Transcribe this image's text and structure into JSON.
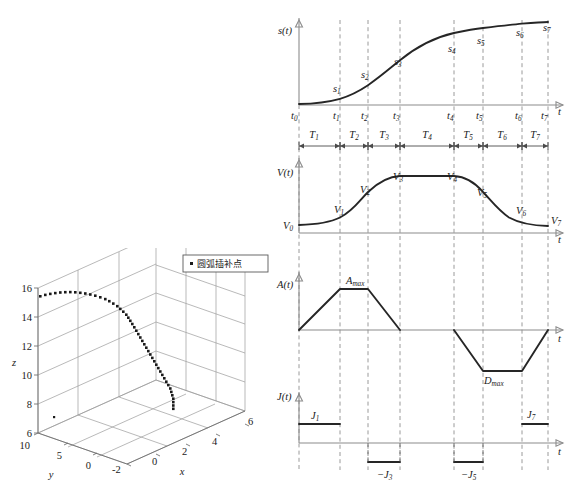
{
  "figure": {
    "background": "#ffffff",
    "curve_color": "#262626",
    "axis_color": "#8c8c8c",
    "dash_color": "#9a9a9a"
  },
  "plot3d": {
    "legend_label": "圆弧插补点",
    "legend_marker": "dot-marker",
    "axis_labels": {
      "x": "x",
      "y": "y",
      "z": "z"
    },
    "z_ticks": [
      "16",
      "14",
      "12",
      "10",
      "8",
      "6"
    ],
    "y_ticks": [
      "10",
      "5",
      "0"
    ],
    "x_ticks": [
      "-2",
      "0",
      "2",
      "4",
      "6"
    ],
    "chart_data": {
      "type": "scatter",
      "title": "",
      "xlabel": "x",
      "ylabel": "y",
      "zlabel": "z",
      "xlim": [
        -2,
        6
      ],
      "ylim": [
        0,
        10
      ],
      "zlim": [
        6,
        16
      ],
      "legend": [
        "圆弧插补点"
      ],
      "legend_position": "top-right",
      "grid": true,
      "series": [
        {
          "name": "圆弧插补点",
          "marker": "square-dot",
          "points_xz": [
            [
              78,
              296
            ],
            [
              83,
              294.6
            ],
            [
              88,
              293.6
            ],
            [
              93,
              292.8
            ],
            [
              98,
              292.2
            ],
            [
              103,
              291.9
            ],
            [
              108,
              291.8
            ],
            [
              113,
              292.0
            ],
            [
              118,
              292.5
            ],
            [
              123,
              293.2
            ],
            [
              128,
              294.2
            ],
            [
              133,
              295.4
            ],
            [
              138,
              297.0
            ],
            [
              143,
              298.8
            ],
            [
              147,
              300.9
            ],
            [
              151,
              303.3
            ],
            [
              155,
              305.9
            ],
            [
              158,
              308.6
            ],
            [
              161,
              311.4
            ],
            [
              164,
              314.4
            ],
            [
              166,
              317.4
            ],
            [
              168,
              320.5
            ],
            [
              170,
              323.7
            ],
            [
              172,
              327.0
            ],
            [
              174,
              330.4
            ],
            [
              176,
              333.8
            ],
            [
              178,
              337.2
            ],
            [
              180,
              340.6
            ],
            [
              182,
              344.0
            ],
            [
              184,
              347.4
            ],
            [
              186,
              350.8
            ],
            [
              188,
              354.2
            ],
            [
              190,
              357.6
            ],
            [
              192,
              361.0
            ],
            [
              194,
              364.4
            ],
            [
              196,
              367.8
            ],
            [
              198,
              371.2
            ],
            [
              200,
              374.6
            ],
            [
              202,
              378.0
            ],
            [
              204,
              381.4
            ],
            [
              206,
              384.8
            ],
            [
              208,
              388.2
            ],
            [
              209,
              391.6
            ],
            [
              210,
              395.0
            ],
            [
              211,
              398.4
            ],
            [
              211,
              401.8
            ],
            [
              211,
              405.2
            ],
            [
              211,
              408.5
            ]
          ]
        }
      ]
    }
  },
  "profiles": {
    "panels": [
      {
        "id": "s",
        "axis_label": "s(t)",
        "taxis_label": "t"
      },
      {
        "id": "v",
        "axis_label": "V(t)",
        "taxis_label": "t"
      },
      {
        "id": "a",
        "axis_label": "A(t)",
        "taxis_label": "t"
      },
      {
        "id": "j",
        "axis_label": "J(t)",
        "taxis_label": "t"
      }
    ],
    "time_marks": [
      "t",
      "t",
      "t",
      "t",
      "t",
      "t",
      "t",
      "t"
    ],
    "time_subs": [
      "0",
      "1",
      "2",
      "3",
      "4",
      "5",
      "6",
      "7"
    ],
    "segments": [
      "T",
      "T",
      "T",
      "T",
      "T",
      "T",
      "T"
    ],
    "segment_subs": [
      "1",
      "2",
      "3",
      "4",
      "5",
      "6",
      "7"
    ],
    "s_points": [
      "s",
      "s",
      "s",
      "s",
      "s",
      "s",
      "s"
    ],
    "s_subs": [
      "1",
      "2",
      "3",
      "4",
      "5",
      "6",
      "7"
    ],
    "v_points": [
      "V",
      "V",
      "V",
      "V",
      "V",
      "V",
      "V",
      "V"
    ],
    "v_subs": [
      "0",
      "1",
      "2",
      "3",
      "4",
      "5",
      "6",
      "7"
    ],
    "a_peak": "A",
    "a_peak_sub": "max",
    "d_peak": "D",
    "d_peak_sub": "max",
    "j_pos1": "J",
    "j_pos1_sub": "1",
    "j_pos7": "J",
    "j_pos7_sub": "7",
    "j_neg3": "−J",
    "j_neg3_sub": "3",
    "j_neg5": "−J",
    "j_neg5_sub": "5",
    "chart_data": {
      "type": "line",
      "title": "S-curve (7-segment) jerk-limited motion profile",
      "xlabel": "t",
      "grid": false,
      "legend_position": "none",
      "x_ticks": [
        "t0",
        "t1",
        "t2",
        "t3",
        "t4",
        "t5",
        "t6",
        "t7"
      ],
      "x_tick_px": [
        299,
        340,
        368,
        400,
        454,
        483,
        522,
        548
      ],
      "segments_px": [
        [
          299,
          340
        ],
        [
          340,
          368
        ],
        [
          368,
          400
        ],
        [
          400,
          454
        ],
        [
          454,
          483
        ],
        [
          483,
          522
        ],
        [
          522,
          548
        ]
      ],
      "series": [
        {
          "name": "s(t)",
          "ylabel": "s(t)",
          "values_norm": [
            0.0,
            0.035,
            0.11,
            0.24,
            0.56,
            0.76,
            0.92,
            1.0
          ]
        },
        {
          "name": "V(t)",
          "ylabel": "V(t)",
          "values_norm": [
            0.12,
            0.28,
            0.72,
            1.0,
            1.0,
            0.72,
            0.28,
            0.15
          ]
        },
        {
          "name": "A(t)",
          "ylabel": "A(t)",
          "values_norm": [
            0.0,
            1.0,
            1.0,
            0.0,
            0.0,
            -1.0,
            -1.0,
            0.0
          ]
        },
        {
          "name": "J(t)",
          "ylabel": "J(t)",
          "values_norm": [
            1.0,
            0.0,
            -1.0,
            0.0,
            -1.0,
            0.0,
            1.0
          ]
        }
      ]
    }
  }
}
